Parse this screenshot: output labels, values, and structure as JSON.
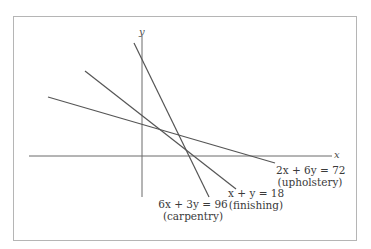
{
  "diagram": {
    "axes": {
      "x_label": "x",
      "y_label": "y"
    },
    "lines": [
      {
        "id": "upholstery",
        "equation": "2x + 6y = 72",
        "name": "(upholstery)"
      },
      {
        "id": "finishing",
        "equation": "x + y = 18",
        "name": "(finishing)"
      },
      {
        "id": "carpentry",
        "equation": "6x + 3y = 96",
        "name": "(carpentry)"
      }
    ],
    "colors": {
      "line": "#5a5a5a",
      "axis": "#6a6a6a",
      "frame": "#b5b5b5",
      "text": "#3a3a3a"
    }
  }
}
